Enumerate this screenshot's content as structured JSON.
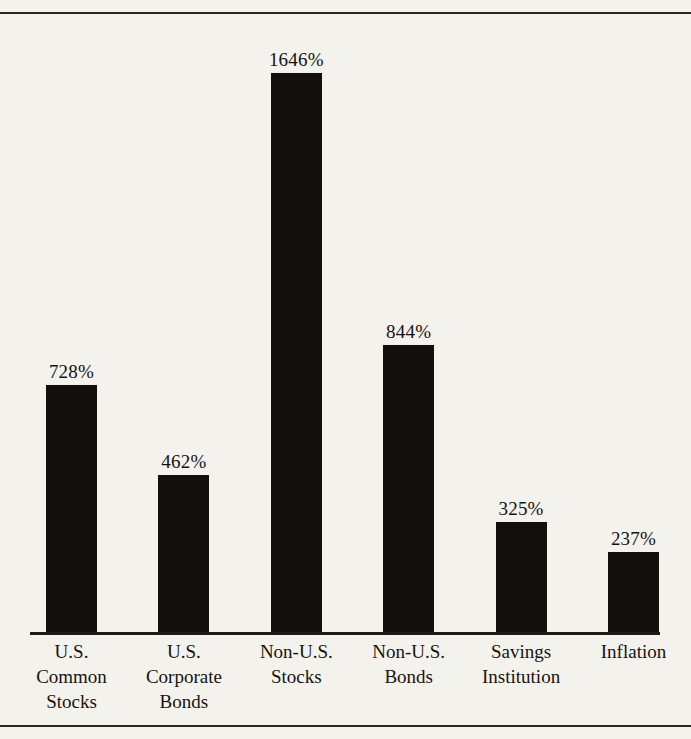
{
  "figure": {
    "background_color": "#f4f2ed",
    "ink_color": "#120f0c",
    "top_rule": "horizontal-rule",
    "bottom_rule": "horizontal-rule",
    "cropped_text_above": ""
  },
  "chart_data": {
    "type": "bar",
    "title": "",
    "subtitle": "",
    "xlabel": "",
    "ylabel": "",
    "grid": false,
    "legend": "none",
    "axis": {
      "baseline_visible": true,
      "y_axis_visible": false,
      "ylim": [
        0,
        1646
      ]
    },
    "value_suffix": "%",
    "categories": [
      "U.S. Common Stocks",
      "U.S. Corporate Bonds",
      "Non-U.S. Stocks",
      "Non-U.S. Bonds",
      "Savings Institution",
      "Inflation"
    ],
    "values": [
      728,
      462,
      1646,
      844,
      325,
      237
    ],
    "value_labels": [
      "728%",
      "462%",
      "1646%",
      "844%",
      "325%",
      "237%"
    ],
    "bars": [
      {
        "index": 0,
        "category": "U.S. Common Stocks",
        "value": 728,
        "value_label": "728%",
        "label_lines": [
          "U.S.",
          "Common",
          "Stocks"
        ]
      },
      {
        "index": 1,
        "category": "U.S. Corporate Bonds",
        "value": 462,
        "value_label": "462%",
        "label_lines": [
          "U.S.",
          "Corporate",
          "Bonds"
        ]
      },
      {
        "index": 2,
        "category": "Non-U.S. Stocks",
        "value": 1646,
        "value_label": "1646%",
        "label_lines": [
          "Non-U.S.",
          "Stocks"
        ]
      },
      {
        "index": 3,
        "category": "Non-U.S. Bonds",
        "value": 844,
        "value_label": "844%",
        "label_lines": [
          "Non-U.S.",
          "Bonds"
        ]
      },
      {
        "index": 4,
        "category": "Savings Institution",
        "value": 325,
        "value_label": "325%",
        "label_lines": [
          "Savings",
          "Institution"
        ]
      },
      {
        "index": 5,
        "category": "Inflation",
        "value": 237,
        "value_label": "237%",
        "label_lines": [
          "Inflation"
        ]
      }
    ]
  }
}
